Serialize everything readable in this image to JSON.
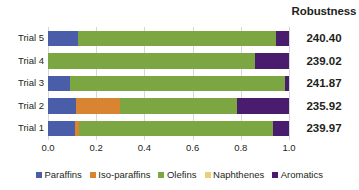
{
  "header": {
    "robustness_title": "Robustness"
  },
  "chart_data": {
    "type": "bar",
    "orientation": "horizontal",
    "stacked": true,
    "normalized": true,
    "title": "",
    "xlabel": "",
    "ylabel": "",
    "xlim": [
      0.0,
      1.0
    ],
    "grid": true,
    "legend_position": "bottom",
    "categories": [
      "Trial 1",
      "Trial 2",
      "Trial 3",
      "Trial 4",
      "Trial 5"
    ],
    "display_order": [
      "Trial 5",
      "Trial 4",
      "Trial 3",
      "Trial 2",
      "Trial 1"
    ],
    "x_ticks": [
      "0.0",
      "0.2",
      "0.4",
      "0.6",
      "0.8",
      "1.0"
    ],
    "x_tick_values": [
      0.0,
      0.2,
      0.4,
      0.6,
      0.8,
      1.0
    ],
    "series": [
      {
        "name": "Paraffins",
        "color": "#4a5da8",
        "values": [
          0.11,
          0.115,
          0.09,
          0.0,
          0.125
        ]
      },
      {
        "name": "Iso-paraffins",
        "color": "#d98430",
        "values": [
          0.02,
          0.185,
          0.0,
          0.0,
          0.0
        ]
      },
      {
        "name": "Olefins",
        "color": "#7ba641",
        "values": [
          0.805,
          0.485,
          0.895,
          0.86,
          0.82
        ]
      },
      {
        "name": "Naphthenes",
        "color": "#e8d17a",
        "values": [
          0.0,
          0.0,
          0.0,
          0.0,
          0.0
        ]
      },
      {
        "name": "Aromatics",
        "color": "#4a1c6e",
        "values": [
          0.065,
          0.215,
          0.015,
          0.14,
          0.055
        ]
      }
    ],
    "annotations": {
      "value_column_header": "Robustness",
      "values": [
        {
          "category": "Trial 5",
          "robustness": "240.40"
        },
        {
          "category": "Trial 4",
          "robustness": "239.02"
        },
        {
          "category": "Trial 3",
          "robustness": "241.87"
        },
        {
          "category": "Trial 2",
          "robustness": "235.92"
        },
        {
          "category": "Trial 1",
          "robustness": "239.97"
        }
      ]
    }
  },
  "rows": [
    {
      "label": "Trial 5",
      "robustness": "240.40",
      "segments": [
        {
          "name": "Paraffins",
          "start": 0.0,
          "end": 0.125,
          "color": "#4a5da8"
        },
        {
          "name": "Olefins",
          "start": 0.125,
          "end": 0.945,
          "color": "#7ba641"
        },
        {
          "name": "Aromatics",
          "start": 0.945,
          "end": 1.0,
          "color": "#4a1c6e"
        }
      ]
    },
    {
      "label": "Trial 4",
      "robustness": "239.02",
      "segments": [
        {
          "name": "Olefins",
          "start": 0.0,
          "end": 0.86,
          "color": "#7ba641"
        },
        {
          "name": "Aromatics",
          "start": 0.86,
          "end": 1.0,
          "color": "#4a1c6e"
        }
      ]
    },
    {
      "label": "Trial 3",
      "robustness": "241.87",
      "segments": [
        {
          "name": "Paraffins",
          "start": 0.0,
          "end": 0.09,
          "color": "#4a5da8"
        },
        {
          "name": "Olefins",
          "start": 0.09,
          "end": 0.985,
          "color": "#7ba641"
        },
        {
          "name": "Aromatics",
          "start": 0.985,
          "end": 1.0,
          "color": "#4a1c6e"
        }
      ]
    },
    {
      "label": "Trial 2",
      "robustness": "235.92",
      "segments": [
        {
          "name": "Paraffins",
          "start": 0.0,
          "end": 0.115,
          "color": "#4a5da8"
        },
        {
          "name": "Iso-paraffins",
          "start": 0.115,
          "end": 0.3,
          "color": "#d98430"
        },
        {
          "name": "Olefins",
          "start": 0.3,
          "end": 0.785,
          "color": "#7ba641"
        },
        {
          "name": "Aromatics",
          "start": 0.785,
          "end": 1.0,
          "color": "#4a1c6e"
        }
      ]
    },
    {
      "label": "Trial 1",
      "robustness": "239.97",
      "segments": [
        {
          "name": "Paraffins",
          "start": 0.0,
          "end": 0.11,
          "color": "#4a5da8"
        },
        {
          "name": "Iso-paraffins",
          "start": 0.11,
          "end": 0.13,
          "color": "#d98430"
        },
        {
          "name": "Olefins",
          "start": 0.13,
          "end": 0.935,
          "color": "#7ba641"
        },
        {
          "name": "Aromatics",
          "start": 0.935,
          "end": 1.0,
          "color": "#4a1c6e"
        }
      ]
    }
  ],
  "x_axis": {
    "ticks": [
      {
        "label": "0.0",
        "value": 0.0
      },
      {
        "label": "0.2",
        "value": 0.2
      },
      {
        "label": "0.4",
        "value": 0.4
      },
      {
        "label": "0.6",
        "value": 0.6
      },
      {
        "label": "0.8",
        "value": 0.8
      },
      {
        "label": "1.0",
        "value": 1.0
      }
    ]
  },
  "legend": {
    "items": [
      {
        "label": "Paraffins",
        "color": "#4a5da8"
      },
      {
        "label": "Iso-paraffins",
        "color": "#d98430"
      },
      {
        "label": "Olefins",
        "color": "#7ba641"
      },
      {
        "label": "Naphthenes",
        "color": "#e8d17a"
      },
      {
        "label": "Aromatics",
        "color": "#4a1c6e"
      }
    ]
  }
}
